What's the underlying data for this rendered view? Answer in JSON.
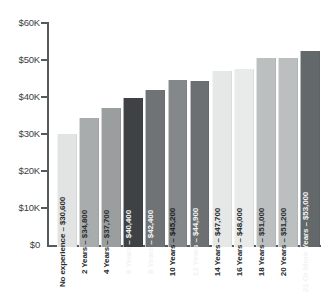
{
  "chart_data": {
    "type": "bar",
    "title": "",
    "xlabel": "",
    "ylabel": "",
    "ylim": [
      0,
      60000
    ],
    "grid": false,
    "legend": "none",
    "ytick_labels": [
      "$60K",
      "$50K",
      "$40K",
      "$30K",
      "$20K",
      "$10K",
      "$0"
    ],
    "ytick_values": [
      60000,
      50000,
      40000,
      30000,
      20000,
      10000,
      0
    ],
    "categories": [
      "No experience",
      "2 Years",
      "4 Years",
      "6 Years",
      "8 Years",
      "10 Years",
      "12 Years",
      "14 Years",
      "16 Years",
      "18 Years",
      "20 Years",
      "21 Or More Years"
    ],
    "values": [
      30600,
      34800,
      37700,
      40400,
      42400,
      45200,
      44900,
      47700,
      48000,
      51000,
      51200,
      53000
    ],
    "value_labels": [
      "$30,600",
      "$34,800",
      "$37,700",
      "$40,400",
      "$42,400",
      "$45,200",
      "$44,900",
      "$47,700",
      "$48,000",
      "$51,000",
      "$51,200",
      "$53,000"
    ],
    "bar_labels": [
      "No experience – $30,600",
      "2 Years – $34,800",
      "4 Years – $37,700",
      "6 Years – $40,400",
      "8 Years – $42,400",
      "10 Years – $45,200",
      "12 Years – $44,900",
      "14 Years – $47,700",
      "16 Years – $48,000",
      "18 Years – $51,000",
      "20 Years – $51,200",
      "21 Or More Years – $53,000"
    ],
    "bar_colors": [
      "#e2e3e3",
      "#a9acad",
      "#9b9e9f",
      "#3f4244",
      "#6f7375",
      "#84888a",
      "#6c7072",
      "#e6e7e7",
      "#e9eaea",
      "#bcbfc0",
      "#bcbfc0",
      "#63686a"
    ],
    "label_colors": [
      "#2a2d2f",
      "#2a2d2f",
      "#2a2d2f",
      "#f2f3f3",
      "#f2f3f3",
      "#1f2223",
      "#f2f3f3",
      "#2a2d2f",
      "#2a2d2f",
      "#2a2d2f",
      "#2a2d2f",
      "#f2f3f3"
    ],
    "axis_color": "#555a5d",
    "background": "#ffffff"
  }
}
